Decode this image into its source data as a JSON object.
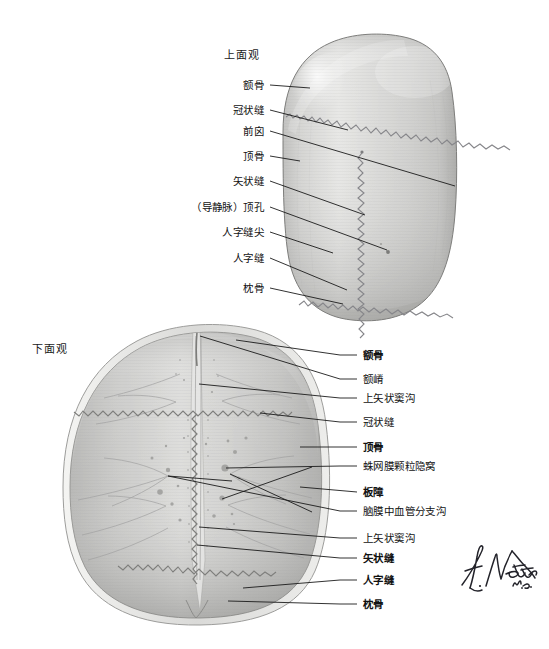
{
  "plate": {
    "figure_kind": "anatomical-illustration",
    "subject": "skull calvaria",
    "artist_signature": "F. Netter M.D."
  },
  "views": {
    "superior": {
      "title": "上面观"
    },
    "inferior": {
      "title": "下面观"
    }
  },
  "superior_labels": [
    {
      "id": "frontal-bone",
      "text": "额骨",
      "bold": false,
      "y": 85,
      "tip_x": 310,
      "tip_y": 88
    },
    {
      "id": "coronal-suture",
      "text": "冠状缝",
      "bold": false,
      "y": 110,
      "tip_x": 345,
      "tip_y": 128
    },
    {
      "id": "bregma",
      "text": "前囟",
      "bold": false,
      "y": 131,
      "tip_x": 371,
      "tip_y": 150
    },
    {
      "id": "parietal-bone",
      "text": "顶骨",
      "bold": false,
      "y": 156,
      "tip_x": 300,
      "tip_y": 161
    },
    {
      "id": "sagittal-suture",
      "text": "矢状缝",
      "bold": false,
      "y": 181,
      "tip_x": 365,
      "tip_y": 214
    },
    {
      "id": "parietal-foramen",
      "text": "（导静脉）顶孔",
      "bold": false,
      "y": 207,
      "tip_x": 388,
      "tip_y": 251
    },
    {
      "id": "lambda",
      "text": "人字缝尖",
      "bold": false,
      "y": 232,
      "tip_x": 333,
      "tip_y": 254
    },
    {
      "id": "lambdoid-suture",
      "text": "人字缝",
      "bold": false,
      "y": 258,
      "tip_x": 344,
      "tip_y": 286
    },
    {
      "id": "occipital-bone",
      "text": "枕骨",
      "bold": false,
      "y": 288,
      "tip_x": 340,
      "tip_y": 303
    }
  ],
  "inferior_labels": [
    {
      "id": "frontal-bone",
      "text": "额骨",
      "bold": true,
      "y": 355,
      "tip_x": 235,
      "tip_y": 340
    },
    {
      "id": "frontal-crest",
      "text": "额嵴",
      "bold": false,
      "y": 379,
      "tip_x": 210,
      "tip_y": 348
    },
    {
      "id": "sagittal-sulcus-upper",
      "text": "上矢状窦沟",
      "bold": false,
      "y": 398,
      "tip_x": 200,
      "tip_y": 382
    },
    {
      "id": "coronal-suture",
      "text": "冠状缝",
      "bold": false,
      "y": 422,
      "tip_x": 258,
      "tip_y": 411
    },
    {
      "id": "parietal-bone",
      "text": "顶骨",
      "bold": true,
      "y": 447,
      "tip_x": 295,
      "tip_y": 447
    },
    {
      "id": "granular-foveolae",
      "text": "蛛网膜颗粒隐窝",
      "bold": false,
      "y": 466,
      "tip_x": 229,
      "tip_y": 467
    },
    {
      "id": "diploe",
      "text": "板障",
      "bold": true,
      "y": 492,
      "tip_x": 297,
      "tip_y": 486
    },
    {
      "id": "middle-meningeal-grooves",
      "text": "脑膜中血管分支沟",
      "bold": false,
      "y": 511,
      "tip_x": 233,
      "tip_y": 480
    },
    {
      "id": "sagittal-sulcus-lower",
      "text": "上矢状窦沟",
      "bold": false,
      "y": 538,
      "tip_x": 200,
      "tip_y": 525
    },
    {
      "id": "sagittal-suture",
      "text": "矢状缝",
      "bold": true,
      "y": 558,
      "tip_x": 196,
      "tip_y": 544
    },
    {
      "id": "lambdoid-suture",
      "text": "人字缝",
      "bold": true,
      "y": 580,
      "tip_x": 240,
      "tip_y": 588
    },
    {
      "id": "occipital-bone",
      "text": "枕骨",
      "bold": true,
      "y": 604,
      "tip_x": 227,
      "tip_y": 600
    }
  ],
  "geometry": {
    "superior_label_right_x": 264,
    "superior_leader_start_x": 270,
    "inferior_label_left_x": 363,
    "inferior_leader_end_x": 357
  },
  "colors": {
    "bone_light": "#e9e9e7",
    "bone_mid": "#d2d2d0",
    "bone_dark": "#a9a9a7",
    "suture_line": "#8d8d8b",
    "leader_line": "#1b1b1b",
    "text": "#111111",
    "background": "#ffffff"
  }
}
